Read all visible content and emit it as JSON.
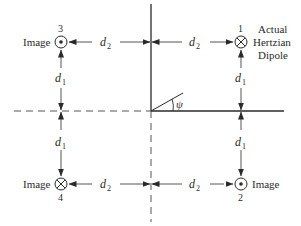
{
  "figure": {
    "colors": {
      "ink": "#2a2a2a",
      "background": "#ffffff"
    },
    "angle_label": "ψ",
    "distance_labels": {
      "d1": "d",
      "d1_sub": "1",
      "d2": "d",
      "d2_sub": "2"
    },
    "sources": [
      {
        "id": "1",
        "number": "1",
        "symbol": "cross-circle-icon",
        "label_lines": [
          "Actual",
          "Hertzian",
          "Dipole"
        ]
      },
      {
        "id": "2",
        "number": "2",
        "symbol": "dot-circle-icon",
        "label_lines": [
          "Image"
        ]
      },
      {
        "id": "3",
        "number": "3",
        "symbol": "dot-circle-icon",
        "label_lines": [
          "Image"
        ]
      },
      {
        "id": "4",
        "number": "4",
        "symbol": "cross-circle-icon",
        "label_lines": [
          "Image"
        ]
      }
    ]
  }
}
